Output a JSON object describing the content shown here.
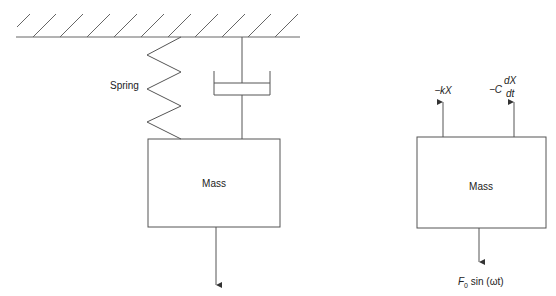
{
  "diagram": {
    "type": "mass-spring-damper",
    "left_system": {
      "spring_label": "Spring",
      "mass_label": "Mass",
      "has_damper": true,
      "has_ceiling": true,
      "force_arrow": "down"
    },
    "free_body": {
      "mass_label": "Mass",
      "forces": [
        {
          "direction": "up",
          "label": "−kX"
        },
        {
          "direction": "up",
          "label_prefix": "−C",
          "numerator": "dX",
          "denominator": "dt"
        },
        {
          "direction": "down",
          "label_main": "F",
          "subscript": "0",
          "label_rest": " sin (ωt)"
        }
      ]
    },
    "colors": {
      "line": "#555555",
      "text": "#222222",
      "background": "#ffffff"
    }
  }
}
